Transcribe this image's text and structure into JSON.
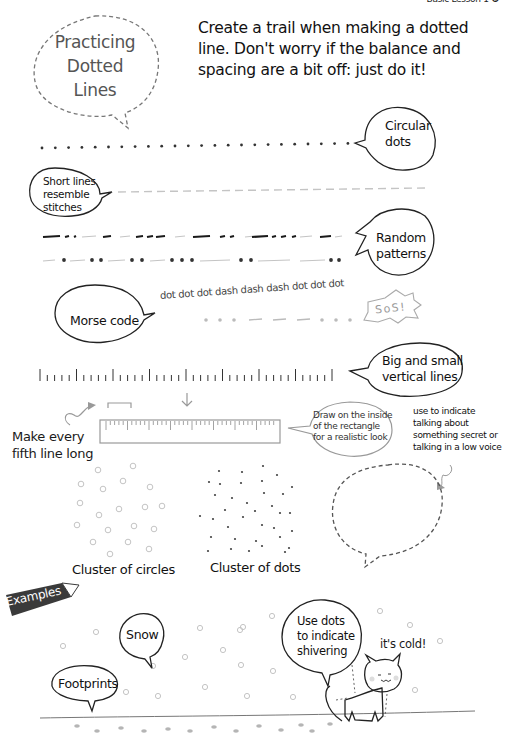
{
  "header": {
    "note": "Basic Lesson 1 ❷"
  },
  "title_bubble": {
    "lines": [
      "Practicing",
      "Dotted",
      "Lines"
    ]
  },
  "intro": {
    "text": "Create a trail when making a dotted line. Don't worry if the balance and spacing are a bit off: just do it!"
  },
  "rows": {
    "circular_dots": {
      "label_lines": [
        "Circular",
        "dots"
      ]
    },
    "stitches": {
      "label_lines": [
        "Short lines",
        "resemble",
        "stitches"
      ]
    },
    "random_patterns": {
      "label_lines": [
        "Random",
        "patterns"
      ]
    },
    "morse": {
      "label": "Morse code",
      "words": "dot dot dot dash dash dash dot dot dot",
      "burst_text": "SoS!"
    },
    "vertical_lines": {
      "label_lines": [
        "Big and small",
        "vertical lines"
      ]
    }
  },
  "ruler": {
    "side_note_lines": [
      "Make every",
      "fifth line long"
    ],
    "tip_lines": [
      "Draw on the inside",
      "of the rectangle",
      "for a realistic look"
    ]
  },
  "whisper": {
    "note_lines": [
      "use to indicate",
      "talking about",
      "something secret or",
      "talking in a low voice"
    ]
  },
  "clusters": {
    "circles_caption": "Cluster of circles",
    "dots_caption": "Cluster of dots"
  },
  "examples": {
    "tag": "Examples",
    "snow_label": "Snow",
    "footprints_label": "Footprints",
    "shiver_lines": [
      "Use dots",
      "to indicate",
      "shivering"
    ],
    "cat_says": "it's cold!"
  },
  "colors": {
    "ink": "#1a1a1a",
    "gray": "#9a9a9a",
    "light_gray": "#c4c4c4",
    "tag_bg": "#3a3a3a"
  }
}
